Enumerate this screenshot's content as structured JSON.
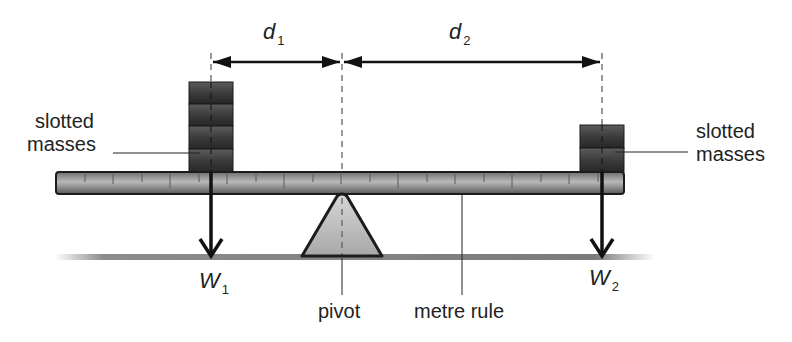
{
  "diagram": {
    "labels": {
      "d1": {
        "symbol": "d",
        "subscript": "1"
      },
      "d2": {
        "symbol": "d",
        "subscript": "2"
      },
      "w1": {
        "symbol": "W",
        "subscript": "1"
      },
      "w2": {
        "symbol": "W",
        "subscript": "2"
      },
      "left_masses_line1": "slotted",
      "left_masses_line2": "masses",
      "right_masses_line1": "slotted",
      "right_masses_line2": "masses",
      "pivot": "pivot",
      "metre_rule": "metre rule"
    },
    "left_mass_count": 4,
    "right_mass_count": 2,
    "colors": {
      "mass_fill": "#3a3a3a",
      "ruler_fill": "#8a8a8a",
      "pivot_fill": "#bdbdbd",
      "ground": "#777777",
      "arrow": "#111111"
    }
  }
}
